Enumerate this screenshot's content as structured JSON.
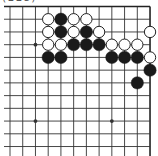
{
  "diagram": {
    "type": "go-board-fragment",
    "label": "(118)",
    "view": {
      "cols": 12,
      "rows": 12,
      "x0": 10,
      "y0": 6.5,
      "spacing": 12.73,
      "edges": {
        "top": true,
        "right": true,
        "left": false,
        "bottom": false
      }
    },
    "colors": {
      "background": "#ffffff",
      "line": "#333333",
      "edge": "#222222",
      "black_stone": "#1a1a1a",
      "white_stone": "#ffffff",
      "white_stroke": "#222222"
    },
    "star_points": [
      {
        "col": 2,
        "row": 3
      },
      {
        "col": 2,
        "row": 9
      },
      {
        "col": 8,
        "row": 9
      }
    ],
    "stones": [
      {
        "color": "white",
        "col": 3,
        "row": 1
      },
      {
        "color": "black",
        "col": 4,
        "row": 1
      },
      {
        "color": "white",
        "col": 5,
        "row": 1
      },
      {
        "color": "white",
        "col": 6,
        "row": 1
      },
      {
        "color": "white",
        "col": 3,
        "row": 2
      },
      {
        "color": "black",
        "col": 4,
        "row": 2
      },
      {
        "color": "white",
        "col": 5,
        "row": 2
      },
      {
        "color": "black",
        "col": 6,
        "row": 2
      },
      {
        "color": "white",
        "col": 7,
        "row": 2
      },
      {
        "color": "white",
        "col": 11,
        "row": 2
      },
      {
        "color": "white",
        "col": 3,
        "row": 3
      },
      {
        "color": "white",
        "col": 4,
        "row": 3
      },
      {
        "color": "black",
        "col": 5,
        "row": 3
      },
      {
        "color": "black",
        "col": 6,
        "row": 3
      },
      {
        "color": "black",
        "col": 7,
        "row": 3
      },
      {
        "color": "white",
        "col": 8,
        "row": 3
      },
      {
        "color": "white",
        "col": 9,
        "row": 3
      },
      {
        "color": "white",
        "col": 10,
        "row": 3
      },
      {
        "color": "black",
        "col": 3,
        "row": 4
      },
      {
        "color": "black",
        "col": 4,
        "row": 4
      },
      {
        "color": "black",
        "col": 8,
        "row": 4
      },
      {
        "color": "black",
        "col": 9,
        "row": 4
      },
      {
        "color": "black",
        "col": 10,
        "row": 4
      },
      {
        "color": "white",
        "col": 11,
        "row": 4
      },
      {
        "color": "black",
        "col": 11,
        "row": 5
      },
      {
        "color": "black",
        "col": 10,
        "row": 6
      }
    ]
  }
}
